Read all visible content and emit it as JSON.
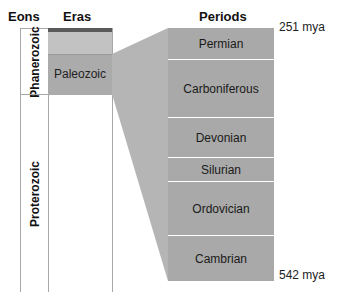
{
  "headers": {
    "eons": "Eons",
    "eras": "Eras",
    "periods": "Periods"
  },
  "eons": [
    {
      "name": "Phanerozoic",
      "top": 28,
      "bottom": 94
    },
    {
      "name": "Proterozoic",
      "top": 94,
      "bottom": 292
    }
  ],
  "eras": [
    {
      "name": "",
      "top": 28,
      "bottom": 32,
      "color": "#5a5a5a"
    },
    {
      "name": "",
      "top": 32,
      "bottom": 54,
      "color": "#c2c2c2"
    },
    {
      "name": "Paleozoic",
      "top": 54,
      "bottom": 94,
      "color": "#ababab"
    }
  ],
  "periods": [
    {
      "name": "Permian",
      "top": 28,
      "bottom": 59
    },
    {
      "name": "Carboniferous",
      "top": 60,
      "bottom": 117
    },
    {
      "name": "Devonian",
      "top": 118,
      "bottom": 157
    },
    {
      "name": "Silurian",
      "top": 158,
      "bottom": 181
    },
    {
      "name": "Ordovician",
      "top": 182,
      "bottom": 235
    },
    {
      "name": "Cambrian",
      "top": 236,
      "bottom": 281
    }
  ],
  "time_labels": {
    "top": "251 mya",
    "bottom": "542 mya"
  },
  "colors": {
    "period_fill": "#a9a9a9",
    "connector_fill": "#b5b5b5",
    "separator": "#e8e8e8",
    "border": "#a8a8a8"
  }
}
